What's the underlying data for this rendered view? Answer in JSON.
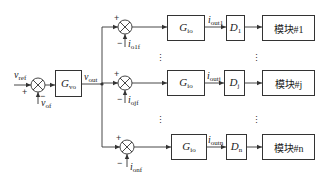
{
  "diagram": {
    "type": "control-block-diagram",
    "inputs": {
      "v_ref": {
        "sym": "v",
        "sub": "ref"
      },
      "v_of": {
        "sym": "v",
        "sub": "of"
      }
    },
    "g_vo": {
      "sym": "G",
      "sub": "vo"
    },
    "v_out": {
      "sym": "v",
      "sub": "out"
    },
    "branches": [
      {
        "id": "1",
        "feedback": {
          "sym": "i",
          "sub": "o1f"
        },
        "g_io": {
          "sym": "G",
          "sub": "io"
        },
        "i_out": {
          "sym": "i",
          "sub": "out1"
        },
        "d": {
          "sym": "D",
          "sub": "1"
        },
        "module": "模块#1"
      },
      {
        "id": "j",
        "feedback": {
          "sym": "i",
          "sub": "ojf"
        },
        "g_io": {
          "sym": "G",
          "sub": "io"
        },
        "i_out": {
          "sym": "i",
          "sub": "outj"
        },
        "d": {
          "sym": "D",
          "sub": "j"
        },
        "module": "模块#j"
      },
      {
        "id": "n",
        "feedback": {
          "sym": "i",
          "sub": "onf"
        },
        "g_io": {
          "sym": "G",
          "sub": "io"
        },
        "i_out": {
          "sym": "i",
          "sub": "outn"
        },
        "d": {
          "sym": "D",
          "sub": "n"
        },
        "module": "模块#n"
      }
    ],
    "signs": {
      "plus": "+",
      "minus": "−"
    },
    "ellipsis": "⋮",
    "colors": {
      "line": "#333333",
      "text": "#222222",
      "background": "#ffffff"
    }
  }
}
